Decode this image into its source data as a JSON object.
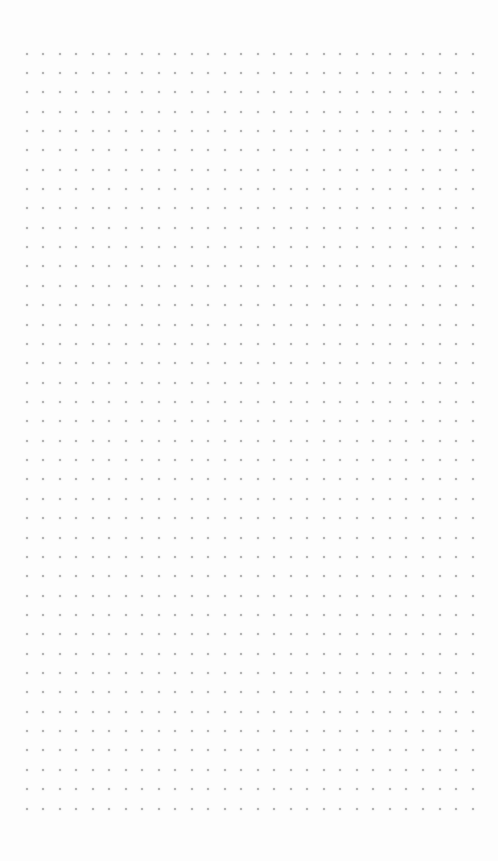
{
  "canvas": {
    "background": "#fdfdfd",
    "grid": {
      "type": "dot",
      "dot_color": "#a6a6a6",
      "origin_x": 26.5,
      "origin_y": 53.5,
      "spacing_x": 16.52,
      "spacing_y": 19.36,
      "columns": 28,
      "rows": 40
    }
  }
}
